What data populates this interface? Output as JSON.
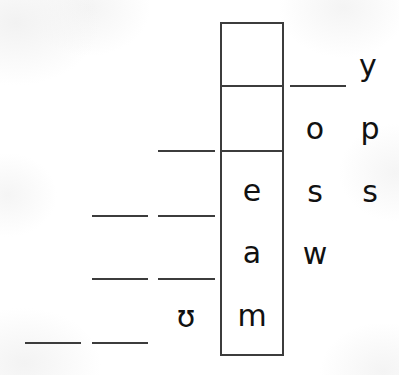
{
  "puzzle": {
    "title": "word-ladder-blank-lines-worksheet",
    "background_color": "#ffffff",
    "ink_color": "#3c3c3c",
    "glyph_color": "#111111",
    "box": {
      "name": "letter-column-box",
      "x": 220,
      "y": 22,
      "width": 64,
      "height": 334,
      "border_width": 2,
      "border_color": "#3c3c3c"
    },
    "box_dividers": [
      {
        "name": "divider-row-1",
        "y": 85,
        "thickness": 2
      },
      {
        "name": "divider-row-2",
        "y": 150,
        "thickness": 2
      }
    ],
    "column_letters": [
      {
        "char": "e",
        "x": 252,
        "y": 206,
        "size": 30
      },
      {
        "char": "a",
        "x": 252,
        "y": 268,
        "size": 30
      },
      {
        "char": "m",
        "x": 252,
        "y": 331,
        "size": 30
      }
    ],
    "right_letters": [
      {
        "char": "y",
        "x": 368,
        "y": 81,
        "size": 30
      },
      {
        "char": "o",
        "x": 315,
        "y": 144,
        "size": 30
      },
      {
        "char": "p",
        "x": 370,
        "y": 144,
        "size": 30
      },
      {
        "char": "s",
        "x": 315,
        "y": 207,
        "size": 30
      },
      {
        "char": "s",
        "x": 370,
        "y": 207,
        "size": 30
      },
      {
        "char": "w",
        "x": 315,
        "y": 269,
        "size": 30
      }
    ],
    "left_letters": [
      {
        "char": "ʊ",
        "x": 186,
        "y": 332,
        "size": 30
      }
    ],
    "blank_lines": [
      {
        "name": "blank-line-r1-right",
        "x": 290,
        "y": 85,
        "width": 56,
        "thickness": 2
      },
      {
        "name": "blank-line-r2-left",
        "x": 158,
        "y": 150,
        "width": 57,
        "thickness": 2
      },
      {
        "name": "blank-line-r3-a",
        "x": 92,
        "y": 215,
        "width": 56,
        "thickness": 2
      },
      {
        "name": "blank-line-r3-b",
        "x": 158,
        "y": 215,
        "width": 57,
        "thickness": 2
      },
      {
        "name": "blank-line-r4-a",
        "x": 92,
        "y": 278,
        "width": 56,
        "thickness": 2
      },
      {
        "name": "blank-line-r4-b",
        "x": 158,
        "y": 278,
        "width": 57,
        "thickness": 2
      },
      {
        "name": "blank-line-r5-a",
        "x": 25,
        "y": 342,
        "width": 56,
        "thickness": 2
      },
      {
        "name": "blank-line-r5-b",
        "x": 92,
        "y": 342,
        "width": 56,
        "thickness": 2
      }
    ]
  }
}
